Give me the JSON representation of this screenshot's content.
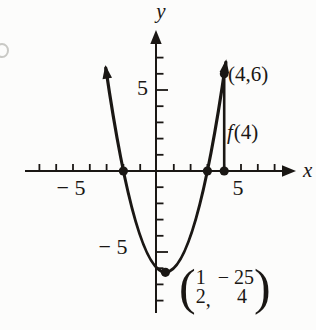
{
  "figure": {
    "ink_color": "#1a1714",
    "background_color": "#fcfcfb"
  },
  "axis_labels": {
    "x": "x",
    "y": "y"
  },
  "tick_labels": {
    "x_negative": "− 5",
    "x_positive": "5",
    "y_negative": "− 5",
    "y_positive": "5"
  },
  "annotations": {
    "point_label": "(4,6)",
    "function_value_f": "f",
    "function_value_args": "(4)",
    "vertex_label": {
      "open_paren": "(",
      "numerator_1": "1",
      "denominator_1": "2",
      "comma": ",",
      "numerator_2": "− 25",
      "denominator_2": "4",
      "close_paren": ")"
    }
  },
  "chart_data": {
    "type": "line",
    "title": "",
    "xlabel": "x",
    "ylabel": "y",
    "xlim": [
      -8,
      8.5
    ],
    "ylim": [
      -8.8,
      8.6
    ],
    "grid": false,
    "legend": false,
    "labeled_ticks": {
      "x": [
        -5,
        5
      ],
      "y": [
        -5,
        5
      ]
    },
    "series": [
      {
        "name": "upward parabola",
        "points_x": [
          -3,
          -2.5,
          -2,
          -1.5,
          -1,
          -0.5,
          0,
          0.5,
          1,
          1.5,
          2,
          2.5,
          3,
          3.5,
          4
        ],
        "points_y": [
          6,
          2.75,
          0,
          -2.25,
          -4,
          -5.25,
          -6,
          -6.25,
          -6,
          -5.25,
          -4,
          -2.25,
          0,
          2.75,
          6
        ]
      }
    ],
    "marked_points": [
      {
        "x": -2,
        "y": 0
      },
      {
        "x": 3,
        "y": 0
      },
      {
        "x": 4,
        "y": 0
      },
      {
        "x": 4,
        "y": 6,
        "label": "(4,6)"
      },
      {
        "x": 0.5,
        "y": -6.25,
        "label": "(1/2, −25/4)"
      }
    ],
    "annotations": [
      {
        "text": "f(4)",
        "description": "vertical segment drawn from (4,0) up to the point (4,6)"
      }
    ]
  }
}
